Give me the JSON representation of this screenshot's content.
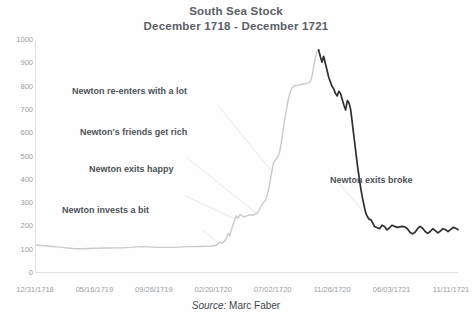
{
  "chart": {
    "title_line1": "South Sea Stock",
    "title_line2": "December 1718 - December 1721",
    "source_label": "Source:",
    "source_value": "Marc Faber"
  },
  "annotations": [
    {
      "id": "a1",
      "text": "Newton invests a bit",
      "x": 62,
      "y": 205
    },
    {
      "id": "a2",
      "text": "Newton exits happy",
      "x": 89,
      "y": 164
    },
    {
      "id": "a3",
      "text": "Newton's friends get rich",
      "x": 80,
      "y": 127
    },
    {
      "id": "a4",
      "text": "Newton re-enters with a lot",
      "x": 72,
      "y": 86
    },
    {
      "id": "a5",
      "text": "Newton exits broke",
      "x": 330,
      "y": 175
    }
  ],
  "chart_data": {
    "type": "line",
    "title": "South Sea Stock December 1718 - December 1721",
    "xlabel": "",
    "ylabel": "",
    "ylim": [
      0,
      1000
    ],
    "ytick_values": [
      0,
      100,
      200,
      300,
      400,
      500,
      600,
      700,
      800,
      900,
      1000
    ],
    "ytick_labels": [
      "0",
      "100",
      "200",
      "300",
      "400",
      "500",
      "600",
      "700",
      "800",
      "900",
      "1000"
    ],
    "xtick_labels": [
      "12/31/1718",
      "05/16/1719",
      "09/26/1719",
      "02/20/1720",
      "07/02/1720",
      "11/26/1720",
      "06/03/1721",
      "11/11/1721"
    ],
    "xtick_positions": [
      0.0,
      0.1405,
      0.281,
      0.4215,
      0.562,
      0.7025,
      0.843,
      0.9835
    ],
    "grid": false,
    "line_color_early": "#c9cbcc",
    "line_color_late": "#2e3033",
    "annotation_leader_color": "#e7e9ea",
    "series": [
      {
        "name": "South Sea Stock price",
        "points": [
          [
            0.0,
            120
          ],
          [
            0.012,
            118
          ],
          [
            0.025,
            116
          ],
          [
            0.038,
            114
          ],
          [
            0.05,
            112
          ],
          [
            0.063,
            110
          ],
          [
            0.075,
            107
          ],
          [
            0.088,
            105
          ],
          [
            0.1,
            104
          ],
          [
            0.113,
            104
          ],
          [
            0.125,
            105
          ],
          [
            0.138,
            106
          ],
          [
            0.15,
            106
          ],
          [
            0.163,
            107
          ],
          [
            0.175,
            107
          ],
          [
            0.188,
            108
          ],
          [
            0.2,
            108
          ],
          [
            0.213,
            109
          ],
          [
            0.225,
            110
          ],
          [
            0.238,
            112
          ],
          [
            0.25,
            113
          ],
          [
            0.263,
            112
          ],
          [
            0.275,
            111
          ],
          [
            0.288,
            110
          ],
          [
            0.3,
            110
          ],
          [
            0.313,
            110
          ],
          [
            0.325,
            110
          ],
          [
            0.338,
            111
          ],
          [
            0.35,
            112
          ],
          [
            0.363,
            113
          ],
          [
            0.375,
            113
          ],
          [
            0.388,
            114
          ],
          [
            0.4,
            115
          ],
          [
            0.413,
            116
          ],
          [
            0.425,
            118
          ],
          [
            0.43,
            125
          ],
          [
            0.435,
            132
          ],
          [
            0.44,
            128
          ],
          [
            0.445,
            135
          ],
          [
            0.45,
            150
          ],
          [
            0.455,
            170
          ],
          [
            0.458,
            160
          ],
          [
            0.462,
            185
          ],
          [
            0.466,
            210
          ],
          [
            0.47,
            230
          ],
          [
            0.474,
            245
          ],
          [
            0.478,
            235
          ],
          [
            0.482,
            250
          ],
          [
            0.486,
            248
          ],
          [
            0.492,
            240
          ],
          [
            0.498,
            245
          ],
          [
            0.505,
            250
          ],
          [
            0.512,
            248
          ],
          [
            0.518,
            252
          ],
          [
            0.524,
            258
          ],
          [
            0.53,
            280
          ],
          [
            0.536,
            300
          ],
          [
            0.542,
            310
          ],
          [
            0.546,
            330
          ],
          [
            0.55,
            360
          ],
          [
            0.554,
            400
          ],
          [
            0.558,
            440
          ],
          [
            0.561,
            470
          ],
          [
            0.564,
            480
          ],
          [
            0.568,
            490
          ],
          [
            0.572,
            500
          ],
          [
            0.576,
            520
          ],
          [
            0.58,
            560
          ],
          [
            0.584,
            610
          ],
          [
            0.588,
            660
          ],
          [
            0.592,
            700
          ],
          [
            0.596,
            740
          ],
          [
            0.6,
            770
          ],
          [
            0.604,
            790
          ],
          [
            0.608,
            800
          ],
          [
            0.612,
            805
          ],
          [
            0.618,
            805
          ],
          [
            0.624,
            808
          ],
          [
            0.63,
            810
          ],
          [
            0.636,
            812
          ],
          [
            0.642,
            815
          ],
          [
            0.648,
            820
          ],
          [
            0.652,
            840
          ],
          [
            0.656,
            880
          ],
          [
            0.66,
            920
          ],
          [
            0.664,
            950
          ],
          [
            0.668,
            958
          ],
          [
            0.672,
            930
          ],
          [
            0.676,
            905
          ],
          [
            0.68,
            930
          ],
          [
            0.684,
            900
          ],
          [
            0.688,
            870
          ],
          [
            0.692,
            840
          ],
          [
            0.696,
            820
          ],
          [
            0.7,
            800
          ],
          [
            0.704,
            790
          ],
          [
            0.708,
            770
          ],
          [
            0.712,
            760
          ],
          [
            0.716,
            780
          ],
          [
            0.72,
            770
          ],
          [
            0.724,
            745
          ],
          [
            0.728,
            720
          ],
          [
            0.732,
            700
          ],
          [
            0.736,
            740
          ],
          [
            0.74,
            730
          ],
          [
            0.744,
            700
          ],
          [
            0.748,
            640
          ],
          [
            0.752,
            580
          ],
          [
            0.756,
            520
          ],
          [
            0.76,
            460
          ],
          [
            0.764,
            410
          ],
          [
            0.768,
            360
          ],
          [
            0.772,
            320
          ],
          [
            0.776,
            285
          ],
          [
            0.78,
            255
          ],
          [
            0.784,
            240
          ],
          [
            0.788,
            230
          ],
          [
            0.792,
            228
          ],
          [
            0.796,
            215
          ],
          [
            0.8,
            200
          ],
          [
            0.806,
            195
          ],
          [
            0.812,
            190
          ],
          [
            0.818,
            205
          ],
          [
            0.824,
            200
          ],
          [
            0.83,
            185
          ],
          [
            0.836,
            195
          ],
          [
            0.842,
            205
          ],
          [
            0.848,
            200
          ],
          [
            0.854,
            196
          ],
          [
            0.86,
            198
          ],
          [
            0.866,
            200
          ],
          [
            0.872,
            198
          ],
          [
            0.878,
            190
          ],
          [
            0.884,
            175
          ],
          [
            0.89,
            168
          ],
          [
            0.896,
            175
          ],
          [
            0.902,
            190
          ],
          [
            0.908,
            200
          ],
          [
            0.914,
            192
          ],
          [
            0.92,
            178
          ],
          [
            0.926,
            170
          ],
          [
            0.932,
            178
          ],
          [
            0.938,
            190
          ],
          [
            0.944,
            182
          ],
          [
            0.95,
            172
          ],
          [
            0.956,
            180
          ],
          [
            0.962,
            190
          ],
          [
            0.968,
            186
          ],
          [
            0.974,
            178
          ],
          [
            0.98,
            186
          ],
          [
            0.986,
            196
          ],
          [
            0.992,
            192
          ],
          [
            0.998,
            186
          ]
        ]
      }
    ],
    "peak_value": 958,
    "start_value": 120,
    "end_value": 130
  }
}
